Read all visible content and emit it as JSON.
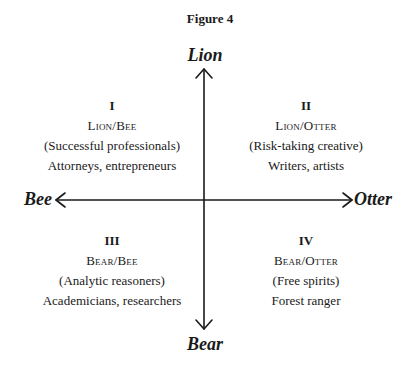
{
  "figure": {
    "title": "Figure 4",
    "axes": {
      "top": "Lion",
      "bottom": "Bear",
      "left": "Bee",
      "right": "Otter"
    },
    "quadrants": [
      {
        "numeral": "I",
        "name": "Lion/Bee",
        "description": "(Successful professionals)",
        "examples": "Attorneys, entrepreneurs"
      },
      {
        "numeral": "II",
        "name": "Lion/Otter",
        "description": "(Risk-taking creative)",
        "examples": "Writers, artists"
      },
      {
        "numeral": "III",
        "name": "Bear/Bee",
        "description": "(Analytic reasoners)",
        "examples": "Academicians, researchers"
      },
      {
        "numeral": "IV",
        "name": "Bear/Otter",
        "description": "(Free spirits)",
        "examples": "Forest ranger"
      }
    ],
    "colors": {
      "ink": "#1a1a1a",
      "background": "#ffffff"
    }
  }
}
